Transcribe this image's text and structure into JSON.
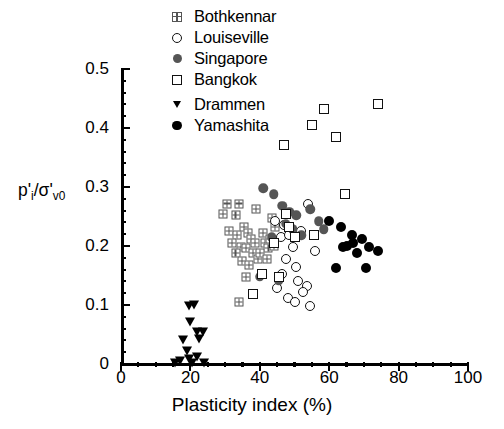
{
  "chart_data": {
    "type": "scatter",
    "title": "",
    "xlabel": "Plasticity index (%)",
    "ylabel": "p'i/σ'v0",
    "xlim": [
      0,
      100
    ],
    "ylim": [
      0,
      0.5
    ],
    "xticks": [
      0,
      20,
      40,
      60,
      80,
      100
    ],
    "yticks": [
      "0",
      "0.1",
      "0.2",
      "0.3",
      "0.4",
      "0.5"
    ],
    "x_minor_step": 5,
    "y_minor_step": 0.02,
    "grid": false,
    "legend_position": "top-center",
    "series": [
      {
        "name": "Bothkennar",
        "marker": "crossed-square",
        "color": "#555555",
        "points": [
          [
            29.5,
            0.255
          ],
          [
            33.0,
            0.252
          ],
          [
            31.0,
            0.225
          ],
          [
            33.5,
            0.218
          ],
          [
            32.0,
            0.205
          ],
          [
            34.5,
            0.198
          ],
          [
            33.0,
            0.188
          ],
          [
            35.5,
            0.232
          ],
          [
            36.5,
            0.222
          ],
          [
            37.5,
            0.212
          ],
          [
            38.5,
            0.205
          ],
          [
            36.0,
            0.196
          ],
          [
            38.0,
            0.188
          ],
          [
            35.0,
            0.175
          ],
          [
            37.0,
            0.168
          ],
          [
            39.5,
            0.178
          ],
          [
            41.0,
            0.222
          ],
          [
            41.5,
            0.205
          ],
          [
            42.5,
            0.196
          ],
          [
            40.0,
            0.188
          ],
          [
            43.0,
            0.212
          ],
          [
            44.0,
            0.2
          ],
          [
            42.0,
            0.178
          ],
          [
            30.5,
            0.272
          ],
          [
            34.0,
            0.272
          ],
          [
            39.0,
            0.262
          ],
          [
            43.5,
            0.248
          ],
          [
            36.0,
            0.148
          ],
          [
            34.0,
            0.105
          ],
          [
            44.5,
            0.232
          ]
        ]
      },
      {
        "name": "Louiseville",
        "marker": "open-circle",
        "color": "#111111",
        "points": [
          [
            44.5,
            0.243
          ],
          [
            47.0,
            0.235
          ],
          [
            46.0,
            0.215
          ],
          [
            48.5,
            0.218
          ],
          [
            54.0,
            0.272
          ],
          [
            52.0,
            0.225
          ],
          [
            49.5,
            0.198
          ],
          [
            47.5,
            0.178
          ],
          [
            50.5,
            0.165
          ],
          [
            46.5,
            0.152
          ],
          [
            51.0,
            0.14
          ],
          [
            53.5,
            0.132
          ],
          [
            52.5,
            0.122
          ],
          [
            48.0,
            0.112
          ],
          [
            50.0,
            0.105
          ],
          [
            54.5,
            0.098
          ],
          [
            45.0,
            0.128
          ],
          [
            56.0,
            0.192
          ]
        ]
      },
      {
        "name": "Singapore",
        "marker": "filled-circle-gray",
        "color": "#555555",
        "points": [
          [
            41.0,
            0.298
          ],
          [
            44.0,
            0.288
          ],
          [
            46.5,
            0.268
          ],
          [
            48.5,
            0.258
          ],
          [
            50.5,
            0.252
          ],
          [
            47.5,
            0.238
          ],
          [
            49.5,
            0.228
          ],
          [
            52.0,
            0.218
          ],
          [
            54.5,
            0.262
          ],
          [
            57.0,
            0.242
          ],
          [
            43.5,
            0.215
          ],
          [
            40.0,
            0.148
          ],
          [
            45.5,
            0.142
          ],
          [
            58.5,
            0.228
          ]
        ]
      },
      {
        "name": "Bangkok",
        "marker": "open-square",
        "color": "#111111",
        "points": [
          [
            58.5,
            0.432
          ],
          [
            74.0,
            0.44
          ],
          [
            55.0,
            0.405
          ],
          [
            62.0,
            0.385
          ],
          [
            47.0,
            0.372
          ],
          [
            64.5,
            0.288
          ],
          [
            48.5,
            0.232
          ],
          [
            50.0,
            0.215
          ],
          [
            55.5,
            0.218
          ],
          [
            44.0,
            0.205
          ],
          [
            40.5,
            0.152
          ],
          [
            45.5,
            0.148
          ],
          [
            38.0,
            0.118
          ],
          [
            47.5,
            0.255
          ]
        ]
      },
      {
        "name": "Drammen",
        "marker": "filled-triangle-down",
        "color": "#000000",
        "points": [
          [
            19.5,
            0.098
          ],
          [
            21.0,
            0.1
          ],
          [
            20.0,
            0.072
          ],
          [
            22.0,
            0.055
          ],
          [
            23.5,
            0.055
          ],
          [
            22.5,
            0.042
          ],
          [
            18.0,
            0.04
          ],
          [
            19.0,
            0.022
          ],
          [
            19.5,
            0.008
          ],
          [
            17.0,
            0.005
          ],
          [
            20.5,
            0.002
          ],
          [
            22.0,
            0.012
          ],
          [
            15.5,
            0.002
          ],
          [
            24.0,
            0.002
          ]
        ]
      },
      {
        "name": "Yamashita",
        "marker": "filled-circle-black",
        "color": "#000000",
        "points": [
          [
            63.5,
            0.232
          ],
          [
            66.5,
            0.218
          ],
          [
            67.0,
            0.205
          ],
          [
            65.0,
            0.2
          ],
          [
            64.0,
            0.198
          ],
          [
            69.5,
            0.212
          ],
          [
            68.0,
            0.188
          ],
          [
            71.5,
            0.198
          ],
          [
            74.0,
            0.192
          ],
          [
            62.0,
            0.162
          ],
          [
            70.5,
            0.162
          ],
          [
            60.0,
            0.242
          ]
        ]
      }
    ]
  },
  "legend": {
    "items": [
      {
        "label": "Bothkennar",
        "marker": "crossed-square"
      },
      {
        "label": "Louiseville",
        "marker": "open-circle"
      },
      {
        "label": "Singapore",
        "marker": "filled-circle-gray"
      },
      {
        "label": "Bangkok",
        "marker": "open-square"
      },
      {
        "label": "Drammen",
        "marker": "filled-triangle-down"
      },
      {
        "label": "Yamashita",
        "marker": "filled-circle-black"
      }
    ]
  }
}
